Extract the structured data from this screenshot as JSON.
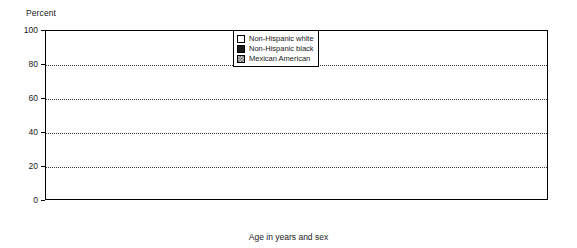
{
  "chart_data": {
    "type": "bar",
    "title": "",
    "xlabel": "Age in years and sex",
    "ylabel": "Percent",
    "ylim": [
      0,
      100
    ],
    "yticks": [
      0,
      20,
      40,
      60,
      80,
      100
    ],
    "grid": true,
    "legend_position": "top-center",
    "categories": [
      "20-39",
      "40-59",
      "≥60"
    ],
    "groups": [
      {
        "name": "Male",
        "categories": [
          "20-39",
          "40-59",
          "≥60"
        ],
        "series": [
          {
            "name": "Non-Hispanic white",
            "values": [
              29,
              32,
              26
            ]
          },
          {
            "name": "Non-Hispanic black",
            "values": [
              11,
              21,
              14
            ]
          },
          {
            "name": "Mexican American",
            "values": [
              19,
              21,
              12
            ]
          }
        ]
      },
      {
        "name": "Female",
        "categories": [
          "20-39",
          "40-59",
          "≥60"
        ],
        "series": [
          {
            "name": "Non-Hispanic white",
            "values": [
              52,
              60,
              40
            ]
          },
          {
            "name": "Non-Hispanic black",
            "values": [
              42,
              48,
              15
            ]
          },
          {
            "name": "Mexican American",
            "values": [
              45,
              45,
              25
            ]
          }
        ]
      }
    ],
    "series_styles": [
      "white",
      "black",
      "mex"
    ]
  },
  "legend": {
    "items": [
      {
        "label": "Non-Hispanic white",
        "style": "white"
      },
      {
        "label": "Non-Hispanic black",
        "style": "black"
      },
      {
        "label": "Mexican American",
        "style": "mex"
      }
    ]
  },
  "axes": {
    "y_title": "Percent",
    "x_title": "Age in years and sex",
    "y_tick_labels": [
      "100",
      "80",
      "60",
      "40",
      "20",
      "0"
    ]
  }
}
